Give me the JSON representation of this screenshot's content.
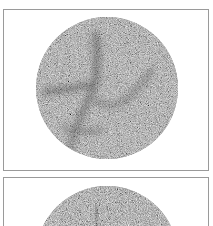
{
  "figure": {
    "panels": [
      {
        "id": "panel-1",
        "subject": "circular grayscale radial-noise scan with dark branching streaks",
        "circle": {
          "cx": 103,
          "cy": 78,
          "r": 71
        },
        "base_gray": "#8a8a8a",
        "streak_color": "#3a3a3a"
      },
      {
        "id": "panel-2",
        "subject": "circular grayscale radial-noise scan (partially visible, cropped at bottom)",
        "circle": {
          "cx": 103,
          "cy": 79,
          "r": 71
        },
        "base_gray": "#8c8c8c",
        "streak_color": "#3e3e3e"
      }
    ],
    "colors": {
      "background": "#ffffff",
      "panel_border": "#9a9a9a"
    }
  }
}
